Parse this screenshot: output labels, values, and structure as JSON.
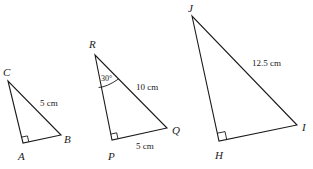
{
  "diagram": {
    "triangles": [
      {
        "name": "ABC",
        "vertices": {
          "C": "C",
          "A": "A",
          "B": "B"
        },
        "right_angle_at": "A",
        "measures": {
          "CB": "5 cm"
        }
      },
      {
        "name": "PQR",
        "vertices": {
          "R": "R",
          "P": "P",
          "Q": "Q"
        },
        "right_angle_at": "P",
        "angle_R": "30°",
        "measures": {
          "RQ": "10 cm",
          "PQ": "5 cm"
        }
      },
      {
        "name": "HIJ",
        "vertices": {
          "J": "J",
          "H": "H",
          "I": "I"
        },
        "right_angle_at": "H",
        "measures": {
          "JI": "12.5 cm"
        }
      }
    ]
  }
}
